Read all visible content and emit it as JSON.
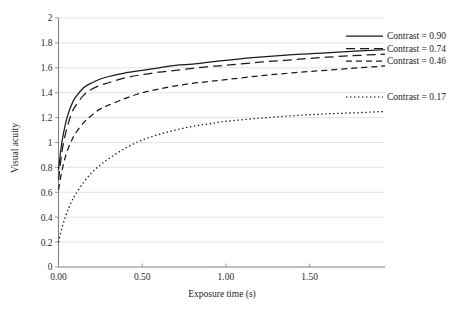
{
  "chart_data": {
    "type": "line",
    "title": "",
    "xlabel": "Exposure time (s)",
    "ylabel": "Visual acuity",
    "xlim": [
      0,
      1.95
    ],
    "ylim": [
      0,
      2
    ],
    "grid": true,
    "legend_position": "right",
    "x_tick_labels": [
      "0.00",
      "0.50",
      "1.00",
      "1.50"
    ],
    "x_tick_values": [
      0,
      0.5,
      1.0,
      1.5
    ],
    "y_tick_labels": [
      "0",
      "0.2",
      "0.4",
      "0.6",
      "0.8",
      "1",
      "1.2",
      "1.4",
      "1.6",
      "1.8",
      "2"
    ],
    "y_tick_values": [
      0,
      0.2,
      0.4,
      0.6,
      0.8,
      1.0,
      1.2,
      1.4,
      1.6,
      1.8,
      2.0
    ],
    "x": [
      0.0,
      0.02,
      0.04,
      0.06,
      0.08,
      0.1,
      0.15,
      0.2,
      0.25,
      0.3,
      0.4,
      0.5,
      0.6,
      0.7,
      0.8,
      0.9,
      1.0,
      1.2,
      1.4,
      1.6,
      1.8,
      1.95
    ],
    "series": [
      {
        "name": "Contrast = 0.90",
        "contrast": 0.9,
        "style": "solid",
        "color": "#1a1a1a",
        "values": [
          0.78,
          1.0,
          1.14,
          1.24,
          1.31,
          1.36,
          1.44,
          1.48,
          1.51,
          1.53,
          1.56,
          1.58,
          1.6,
          1.62,
          1.63,
          1.645,
          1.66,
          1.685,
          1.705,
          1.72,
          1.735,
          1.745
        ]
      },
      {
        "name": "Contrast = 0.74",
        "contrast": 0.74,
        "style": "long-dash",
        "color": "#1a1a1a",
        "values": [
          0.7,
          0.92,
          1.06,
          1.16,
          1.24,
          1.29,
          1.38,
          1.43,
          1.46,
          1.48,
          1.52,
          1.545,
          1.565,
          1.58,
          1.595,
          1.61,
          1.62,
          1.645,
          1.665,
          1.685,
          1.7,
          1.71
        ]
      },
      {
        "name": "Contrast = 0.46",
        "contrast": 0.46,
        "style": "dash",
        "color": "#1a1a1a",
        "values": [
          0.62,
          0.77,
          0.88,
          0.96,
          1.02,
          1.07,
          1.16,
          1.22,
          1.27,
          1.3,
          1.355,
          1.4,
          1.43,
          1.455,
          1.475,
          1.49,
          1.505,
          1.535,
          1.56,
          1.58,
          1.6,
          1.615
        ]
      },
      {
        "name": "Contrast = 0.17",
        "contrast": 0.17,
        "style": "dotted",
        "color": "#555555",
        "values": [
          0.2,
          0.31,
          0.4,
          0.47,
          0.53,
          0.58,
          0.68,
          0.76,
          0.82,
          0.87,
          0.955,
          1.02,
          1.065,
          1.1,
          1.13,
          1.15,
          1.17,
          1.195,
          1.215,
          1.23,
          1.24,
          1.25
        ]
      }
    ]
  },
  "legend": {
    "entries": [
      {
        "label": "Contrast = 0.90"
      },
      {
        "label": "Contrast = 0.74"
      },
      {
        "label": "Contrast = 0.46"
      },
      {
        "label": "Contrast = 0.17"
      }
    ]
  }
}
